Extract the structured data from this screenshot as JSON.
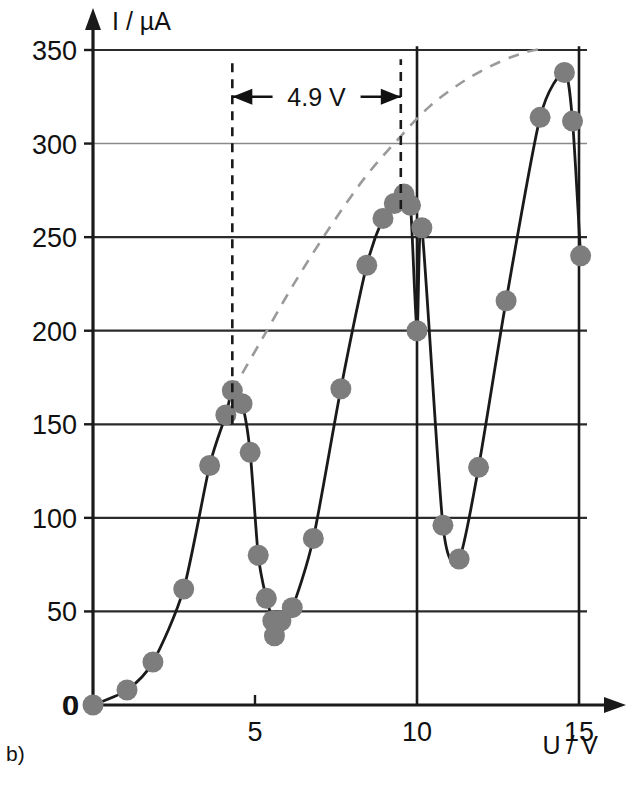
{
  "figure": {
    "panel_label": "b)"
  },
  "chart_data": {
    "type": "scatter",
    "title": "",
    "subtitle": "",
    "xlabel": "U / V",
    "ylabel": "I / µA",
    "xlim": [
      0,
      15.6
    ],
    "ylim": [
      0,
      365
    ],
    "xticks": [
      0,
      5,
      10,
      15
    ],
    "xticklabels": [
      "0",
      "5",
      "10",
      "15"
    ],
    "yticks": [
      0,
      50,
      100,
      150,
      200,
      250,
      300,
      350
    ],
    "yticklabels": [
      "0",
      "50",
      "100",
      "150",
      "200",
      "250",
      "300",
      "350"
    ],
    "grid": "horizontal gridlines at every 50 uA plus vertical lines at 10 V and 15 V",
    "legend": "none",
    "marker_color": "#7d7d7d",
    "curve_color": "#1a1a1a",
    "dashed_color": "#9a9a9a",
    "series": [
      {
        "name": "Franck-Hertz measured current",
        "style": "solid line with filled circular markers",
        "x": [
          0.0,
          1.05,
          1.85,
          2.8,
          3.6,
          4.1,
          4.3,
          4.6,
          4.85,
          5.1,
          5.35,
          5.55,
          5.6,
          5.8,
          6.15,
          6.8,
          7.65,
          8.45,
          8.95,
          9.3,
          9.6,
          9.8,
          10.0,
          10.15,
          10.8,
          11.3,
          11.9,
          12.75,
          13.8,
          14.55,
          14.8,
          15.05
        ],
        "y": [
          0,
          8,
          23,
          62,
          128,
          155,
          168,
          161,
          135,
          80,
          57,
          45,
          37,
          45,
          52,
          89,
          169,
          235,
          260,
          268,
          273,
          267,
          200,
          255,
          96,
          78,
          127,
          216,
          314,
          338,
          312,
          240
        ]
      },
      {
        "name": "Envelope (dashed guide curve)",
        "style": "dashed line, no markers",
        "x": [
          4.3,
          5.2,
          6.2,
          7.3,
          8.4,
          9.4,
          10.4,
          11.5,
          12.6,
          13.4,
          14.0
        ],
        "y": [
          168,
          195,
          225,
          255,
          282,
          302,
          320,
          334,
          344,
          349,
          351
        ]
      }
    ],
    "annotations": [
      {
        "name": "peak-spacing",
        "text": "4.9 V",
        "type": "double-headed horizontal arrow with dashed vertical guides",
        "x_from": 4.3,
        "x_to": 9.5,
        "y": 325,
        "guide_lines": [
          {
            "x": 4.3,
            "y_from": 150,
            "y_to": 345
          },
          {
            "x": 9.5,
            "y_from": 265,
            "y_to": 345
          }
        ]
      }
    ]
  },
  "axes": {
    "y_axis_caption": "I / µA",
    "x_axis_caption": "U / V"
  }
}
